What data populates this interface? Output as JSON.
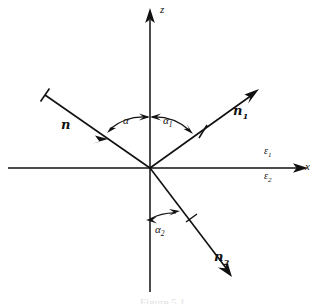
{
  "figure": {
    "caption": "Figure 5.1",
    "background_color": "#ffffff",
    "ink_color": "#111111"
  },
  "axes": {
    "vertical": {
      "name": "z-axis",
      "label": "z",
      "direction": "up",
      "arrow": "arrowhead-up"
    },
    "horizontal": {
      "name": "x-axis",
      "label": "x",
      "direction": "right",
      "arrow": "arrowhead-right"
    },
    "origin": {
      "x": 150,
      "y": 168
    }
  },
  "media": {
    "upper": {
      "label": "ε",
      "subscript": "1"
    },
    "lower": {
      "label": "ε",
      "subscript": "2"
    }
  },
  "vectors": [
    {
      "id": "n",
      "label": "n",
      "subscript": "",
      "role": "incident-ray",
      "from": {
        "x": 45,
        "y": 95
      },
      "to": {
        "x": 150,
        "y": 168
      },
      "arrow_position": "mid-ray-inward",
      "tick": "outer-end"
    },
    {
      "id": "n1",
      "label": "n",
      "subscript": "1",
      "role": "reflected-ray",
      "from": {
        "x": 150,
        "y": 168
      },
      "to": {
        "x": 256,
        "y": 92
      },
      "arrow_position": "tip",
      "tick": "mid-ray"
    },
    {
      "id": "n2",
      "label": "n",
      "subscript": "2",
      "role": "refracted-ray",
      "from": {
        "x": 150,
        "y": 168
      },
      "to": {
        "x": 230,
        "y": 274
      },
      "arrow_position": "tip",
      "tick": "mid-ray"
    }
  ],
  "angles": [
    {
      "id": "alpha",
      "label": "α",
      "subscript": "",
      "between": "incident-ray and +z axis",
      "side": "left"
    },
    {
      "id": "alpha1",
      "label": "α",
      "subscript": "1",
      "between": "+z axis and reflected-ray",
      "side": "right"
    },
    {
      "id": "alpha2",
      "label": "α",
      "subscript": "2",
      "between": "-z axis and refracted-ray",
      "side": "lower-right"
    }
  ]
}
